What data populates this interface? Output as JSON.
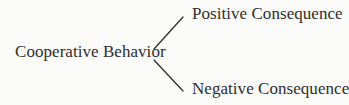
{
  "diagram": {
    "type": "tree",
    "root": {
      "label": "Cooperative Behavior"
    },
    "children": [
      {
        "label": "Positive Consequence"
      },
      {
        "label": "Negative Consequence"
      }
    ],
    "edges": [
      {
        "from": "Cooperative Behavior",
        "to": "Positive Consequence"
      },
      {
        "from": "Cooperative Behavior",
        "to": "Negative Consequence"
      }
    ],
    "colors": {
      "text": "#2e2e2e",
      "line": "#2e2e2e",
      "background": "#fbfbf9"
    }
  }
}
